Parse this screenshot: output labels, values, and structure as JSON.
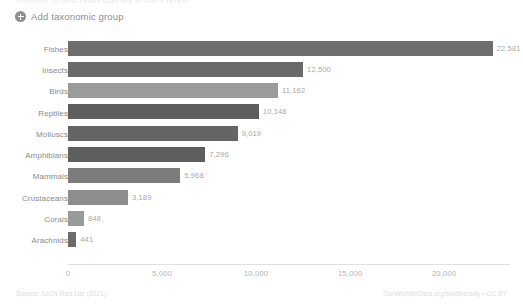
{
  "header": {
    "cutoff_text": "Number of described species in each group",
    "add_group_label": "Add taxonomic group",
    "add_group_icon": "plus-circle-icon"
  },
  "footer": {
    "source": "Source: IUCN Red List (2021)",
    "attribution": "OurWorldInData.org/biodiversity • CC BY"
  },
  "chart_data": {
    "type": "bar",
    "orientation": "horizontal",
    "title": "",
    "subtitle": "",
    "xlabel": "",
    "ylabel": "",
    "xlim": [
      0,
      23500
    ],
    "grid": false,
    "legend": "none",
    "categories": [
      "Fishes",
      "Insects",
      "Birds",
      "Reptiles",
      "Molluscs",
      "Amphibians",
      "Mammals",
      "Crustaceans",
      "Corals",
      "Arachnids"
    ],
    "values": [
      22581,
      12500,
      11162,
      10148,
      9019,
      7296,
      5968,
      3189,
      848,
      441
    ],
    "value_labels": [
      "22,581",
      "12,500",
      "11,162",
      "10,148",
      "9,019",
      "7,296",
      "5,968",
      "3,189",
      "848",
      "441"
    ],
    "colors": [
      "#6e6e6e",
      "#6a6a6a",
      "#9b9b9b",
      "#5e5e5e",
      "#656565",
      "#5f5f5f",
      "#7c7c7c",
      "#8d8d8d",
      "#9a9a9a",
      "#6b6b6b"
    ],
    "xticks": [
      0,
      5000,
      10000,
      15000,
      20000
    ],
    "xtick_labels": [
      "0",
      "5,000",
      "10,000",
      "15,000",
      "20,000"
    ]
  }
}
